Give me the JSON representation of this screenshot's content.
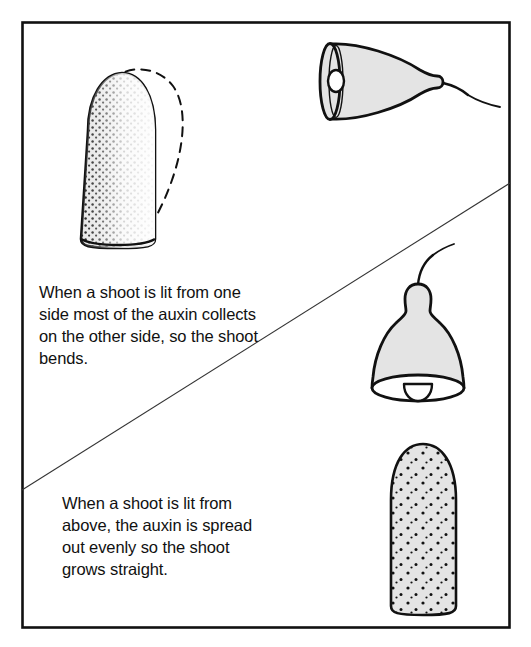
{
  "figure": {
    "title_visible": false,
    "kind": "biology-diagram",
    "topic": "phototropism-auxin-distribution",
    "border_color": "#111111",
    "fill_color": "#e4e4e4",
    "stroke_color": "#111111",
    "background_color": "#ffffff"
  },
  "panels": {
    "top": {
      "caption": "When a shoot is lit from one side most of the auxin collects on the other side, so the shoot bends.",
      "caption_lines": [
        "When a shoot is lit from one",
        "side most of the auxin",
        "collects on the other",
        "side, so the shoot",
        "bends."
      ],
      "lamp": {
        "name": "side-lamp",
        "direction": "pointing-left",
        "has_bulb": true,
        "has_cord": true
      },
      "shoot": {
        "name": "bent-shoot",
        "auxin_distribution": "concentrated-on-shaded-side",
        "shaded_side": "left",
        "lit_side": "right",
        "has_dashed_bend_outline": true,
        "bend_direction": "right"
      }
    },
    "bottom": {
      "caption": "When a shoot is lit from above, the auxin is spread out evenly so the shoot grows straight.",
      "caption_lines": [
        "When a shoot is lit",
        "from above, the auxin",
        "is spread out evenly",
        "so the shoot grows",
        "straight."
      ],
      "lamp": {
        "name": "overhead-lamp",
        "direction": "pointing-down",
        "has_bulb": true,
        "has_cord": true
      },
      "shoot": {
        "name": "straight-shoot",
        "auxin_distribution": "even",
        "has_dashed_bend_outline": false,
        "bend_direction": "none"
      }
    }
  },
  "divider": {
    "name": "diagonal-divider",
    "from": [
      22,
      490
    ],
    "to": [
      510,
      183
    ]
  }
}
